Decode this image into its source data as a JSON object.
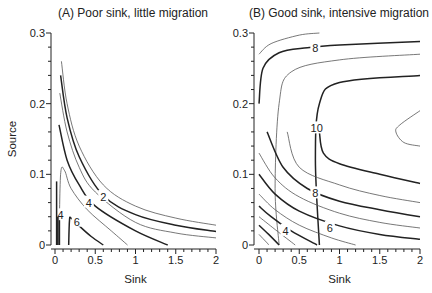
{
  "chart_data": [
    {
      "type": "contour",
      "title": "(A) Poor sink, little migration",
      "xlabel": "Sink",
      "ylabel": "Source",
      "xlim": [
        0,
        2
      ],
      "ylim": [
        0,
        0.3
      ],
      "xticks": [
        "0",
        "0.5",
        "1",
        "1.5",
        "2"
      ],
      "yticks": [
        "0",
        "0.1",
        "0.2",
        "0.3"
      ],
      "contour_labels": [
        {
          "text": "2",
          "x": 0.6,
          "y": 0.068
        },
        {
          "text": "4",
          "x": 0.42,
          "y": 0.06
        },
        {
          "text": "4",
          "x": 0.07,
          "y": 0.042
        },
        {
          "text": "6",
          "x": 0.27,
          "y": 0.033
        }
      ],
      "contours": [
        {
          "level": 1,
          "style": "thin",
          "points": [
            [
              0.08,
              0.26
            ],
            [
              0.15,
              0.2
            ],
            [
              0.3,
              0.14
            ],
            [
              0.6,
              0.085
            ],
            [
              1.0,
              0.055
            ],
            [
              1.5,
              0.038
            ],
            [
              2.0,
              0.028
            ]
          ]
        },
        {
          "level": 2,
          "style": "thick",
          "points": [
            [
              0.07,
              0.24
            ],
            [
              0.15,
              0.18
            ],
            [
              0.3,
              0.125
            ],
            [
              0.6,
              0.07
            ],
            [
              1.0,
              0.043
            ],
            [
              1.5,
              0.028
            ],
            [
              2.0,
              0.019
            ]
          ]
        },
        {
          "level": 3,
          "style": "thin",
          "points": [
            [
              0.06,
              0.215
            ],
            [
              0.15,
              0.16
            ],
            [
              0.3,
              0.11
            ],
            [
              0.5,
              0.075
            ],
            [
              1.0,
              0.032
            ],
            [
              1.5,
              0.017
            ],
            [
              2.0,
              0.01
            ]
          ]
        },
        {
          "level": 4,
          "style": "thick",
          "points": [
            [
              0.05,
              0.17
            ],
            [
              0.15,
              0.12
            ],
            [
              0.3,
              0.085
            ],
            [
              0.5,
              0.055
            ],
            [
              1.0,
              0.02
            ],
            [
              1.4,
              0.0
            ]
          ]
        },
        {
          "level": 5,
          "style": "thin",
          "points": [
            [
              0.05,
              0.0
            ],
            [
              0.07,
              0.1
            ],
            [
              0.12,
              0.105
            ],
            [
              0.2,
              0.08
            ],
            [
              0.4,
              0.05
            ],
            [
              0.7,
              0.02
            ],
            [
              0.9,
              0.0
            ]
          ]
        },
        {
          "level": 6,
          "style": "thick",
          "points": [
            [
              0.17,
              0.0
            ],
            [
              0.18,
              0.035
            ],
            [
              0.2,
              0.038
            ],
            [
              0.3,
              0.027
            ],
            [
              0.45,
              0.012
            ],
            [
              0.6,
              0.0
            ]
          ]
        }
      ]
    },
    {
      "type": "contour",
      "title": "(B) Good sink, intensive migration",
      "xlabel": "Sink",
      "ylabel": "",
      "xlim": [
        0,
        2
      ],
      "ylim": [
        0,
        0.3
      ],
      "xticks": [
        "0",
        "0.5",
        "1",
        "1.5",
        "2"
      ],
      "yticks": [
        "0",
        "0.1",
        "0.2",
        "0.3"
      ],
      "contour_labels": [
        {
          "text": "8",
          "x": 0.7,
          "y": 0.279
        },
        {
          "text": "10",
          "x": 0.68,
          "y": 0.165
        },
        {
          "text": "8",
          "x": 0.7,
          "y": 0.073
        },
        {
          "text": "6",
          "x": 0.88,
          "y": 0.024
        },
        {
          "text": "4",
          "x": 0.33,
          "y": 0.02
        }
      ],
      "contours": [
        {
          "level": 7,
          "style": "thin",
          "points": [
            [
              0.0,
              0.27
            ],
            [
              0.15,
              0.285
            ],
            [
              0.5,
              0.297
            ],
            [
              0.75,
              0.3
            ]
          ]
        },
        {
          "level": 8,
          "style": "thick",
          "points": [
            [
              0.0,
              0.2
            ],
            [
              0.05,
              0.25
            ],
            [
              0.25,
              0.272
            ],
            [
              0.6,
              0.279
            ],
            [
              1.0,
              0.283
            ],
            [
              2.0,
              0.288
            ]
          ]
        },
        {
          "level": 9,
          "style": "thin",
          "points": [
            [
              0.25,
              0.0
            ],
            [
              0.2,
              0.08
            ],
            [
              0.25,
              0.2
            ],
            [
              0.4,
              0.245
            ],
            [
              1.0,
              0.262
            ],
            [
              2.0,
              0.27
            ]
          ]
        },
        {
          "level": 10,
          "style": "thick",
          "points": [
            [
              0.75,
              0.0
            ],
            [
              0.7,
              0.12
            ],
            [
              0.75,
              0.2
            ],
            [
              1.0,
              0.23
            ],
            [
              2.0,
              0.24
            ]
          ]
        },
        {
          "level": 11,
          "style": "thin",
          "points": [
            [
              2.0,
              0.19
            ],
            [
              1.75,
              0.17
            ],
            [
              1.7,
              0.16
            ],
            [
              1.8,
              0.145
            ],
            [
              2.0,
              0.14
            ]
          ]
        },
        {
          "level": 10,
          "style": "thick",
          "points": [
            [
              0.75,
              0.16
            ],
            [
              0.8,
              0.13
            ],
            [
              1.0,
              0.115
            ],
            [
              1.5,
              0.1
            ],
            [
              2.0,
              0.087
            ]
          ]
        },
        {
          "level": 9,
          "style": "thin",
          "points": [
            [
              0.35,
              0.16
            ],
            [
              0.5,
              0.11
            ],
            [
              1.0,
              0.085
            ],
            [
              1.5,
              0.07
            ],
            [
              2.0,
              0.06
            ]
          ]
        },
        {
          "level": 8,
          "style": "thick",
          "points": [
            [
              0.1,
              0.16
            ],
            [
              0.3,
              0.11
            ],
            [
              0.6,
              0.08
            ],
            [
              1.0,
              0.062
            ],
            [
              1.5,
              0.05
            ],
            [
              2.0,
              0.04
            ]
          ]
        },
        {
          "level": 7,
          "style": "thin",
          "points": [
            [
              0.0,
              0.13
            ],
            [
              0.2,
              0.095
            ],
            [
              0.5,
              0.068
            ],
            [
              1.0,
              0.045
            ],
            [
              1.5,
              0.032
            ],
            [
              2.0,
              0.024
            ]
          ]
        },
        {
          "level": 6,
          "style": "thick",
          "points": [
            [
              0.0,
              0.1
            ],
            [
              0.2,
              0.072
            ],
            [
              0.5,
              0.048
            ],
            [
              1.0,
              0.027
            ],
            [
              1.5,
              0.015
            ],
            [
              2.0,
              0.008
            ]
          ]
        },
        {
          "level": 5,
          "style": "thin",
          "points": [
            [
              0.0,
              0.072
            ],
            [
              0.2,
              0.05
            ],
            [
              0.5,
              0.028
            ],
            [
              0.9,
              0.01
            ],
            [
              1.2,
              0.0
            ]
          ]
        },
        {
          "level": 4,
          "style": "thick",
          "points": [
            [
              0.0,
              0.055
            ],
            [
              0.15,
              0.04
            ],
            [
              0.4,
              0.02
            ],
            [
              0.72,
              0.0
            ]
          ]
        },
        {
          "level": 3,
          "style": "thin",
          "points": [
            [
              0.0,
              0.04
            ],
            [
              0.2,
              0.022
            ],
            [
              0.45,
              0.0
            ]
          ]
        },
        {
          "level": 2,
          "style": "thick",
          "points": [
            [
              0.0,
              0.028
            ],
            [
              0.12,
              0.015
            ],
            [
              0.25,
              0.0
            ]
          ]
        },
        {
          "level": 1,
          "style": "thin",
          "points": [
            [
              0.0,
              0.015
            ],
            [
              0.1,
              0.003
            ],
            [
              0.12,
              0.0
            ]
          ]
        }
      ]
    }
  ],
  "panels": [
    {
      "title": "(A) Poor sink, little migration",
      "xlabel": "Sink",
      "ylabel": "Source"
    },
    {
      "title": "(B) Good sink, intensive migration",
      "xlabel": "Sink"
    }
  ]
}
